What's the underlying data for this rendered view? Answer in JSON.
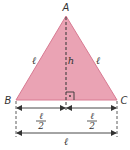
{
  "diagram": {
    "colors": {
      "fill": "#eaa3b4",
      "edge": "#d87a92",
      "line": "#333333",
      "text": "#333333"
    },
    "vertices": {
      "A": {
        "label": "A",
        "x": 66,
        "y": 16
      },
      "B": {
        "label": "B",
        "x": 16,
        "y": 100
      },
      "C": {
        "label": "C",
        "x": 117,
        "y": 100
      }
    },
    "foot": {
      "x": 66,
      "y": 100
    },
    "labels": {
      "left_side": "ℓ",
      "right_side": "ℓ",
      "height": "h",
      "half_left_num": "ℓ",
      "half_left_den": "2",
      "half_right_num": "ℓ",
      "half_right_den": "2",
      "base": "ℓ"
    },
    "right_angle_marker": true
  }
}
